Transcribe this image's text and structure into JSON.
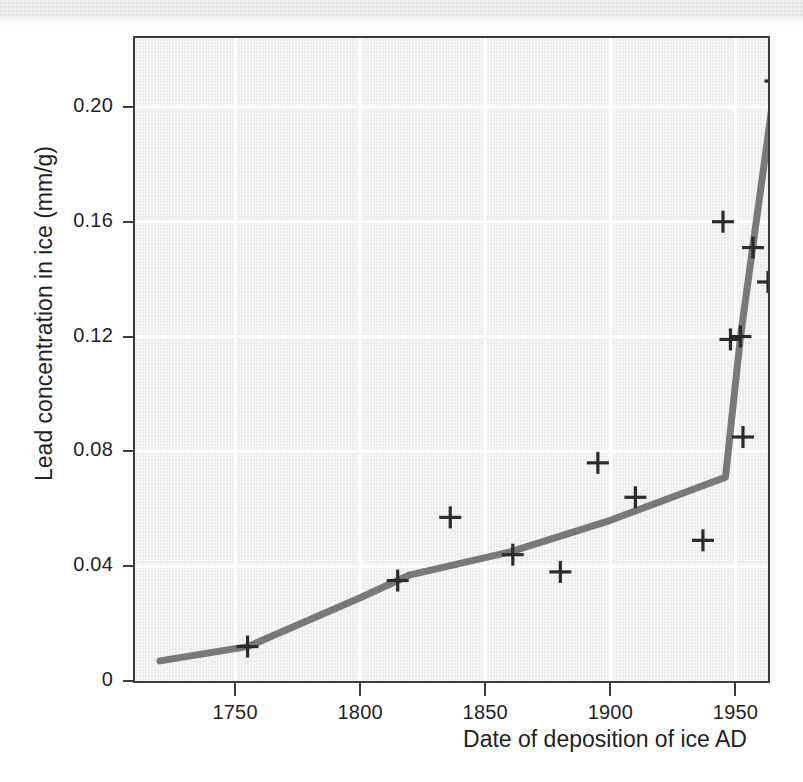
{
  "figure": {
    "background_color": "#ffffff",
    "plot_background_color": "#ebebeb",
    "frame_color": "#3b3b3b",
    "grid_color": "#ffffff",
    "line_color": "#6e6e6e",
    "marker_color": "#2b2b2b"
  },
  "chart_data": {
    "type": "scatter",
    "title": "",
    "subtitle": "",
    "xlabel": "Date of deposition of ice AD",
    "ylabel": "Lead concentration in ice (mm/g)",
    "xlim": [
      1710,
      1963
    ],
    "ylim": [
      0,
      0.224
    ],
    "xticks": [
      1750,
      1800,
      1850,
      1900,
      1950
    ],
    "xticklabels": [
      "1750",
      "1800",
      "1850",
      "1900",
      "1950"
    ],
    "yticks": [
      0,
      0.04,
      0.08,
      0.12,
      0.16,
      0.2
    ],
    "yticklabels": [
      "0",
      "0.04",
      "0.08",
      "0.12",
      "0.16",
      "0.20"
    ],
    "grid": true,
    "grid_axis": "both",
    "legend": false,
    "legend_position": "none",
    "marker_symbol": "plus",
    "series": [
      {
        "name": "Measured lead concentration",
        "type": "scatter",
        "marker": "+",
        "points": [
          {
            "x": 1755,
            "y": 0.012
          },
          {
            "x": 1815,
            "y": 0.035
          },
          {
            "x": 1836,
            "y": 0.057
          },
          {
            "x": 1861,
            "y": 0.044
          },
          {
            "x": 1880,
            "y": 0.038
          },
          {
            "x": 1895,
            "y": 0.076
          },
          {
            "x": 1910,
            "y": 0.064
          },
          {
            "x": 1937,
            "y": 0.049
          },
          {
            "x": 1948,
            "y": 0.119
          },
          {
            "x": 1952,
            "y": 0.12
          },
          {
            "x": 1953,
            "y": 0.085
          },
          {
            "x": 1945,
            "y": 0.16
          },
          {
            "x": 1957,
            "y": 0.151
          },
          {
            "x": 1963,
            "y": 0.139
          },
          {
            "x": 1966,
            "y": 0.209
          }
        ]
      },
      {
        "name": "Trend line",
        "type": "line",
        "points": [
          {
            "x": 1720,
            "y": 0.007
          },
          {
            "x": 1755,
            "y": 0.012
          },
          {
            "x": 1800,
            "y": 0.029
          },
          {
            "x": 1820,
            "y": 0.037
          },
          {
            "x": 1860,
            "y": 0.045
          },
          {
            "x": 1900,
            "y": 0.056
          },
          {
            "x": 1946,
            "y": 0.071
          },
          {
            "x": 1952,
            "y": 0.12
          },
          {
            "x": 1966,
            "y": 0.209
          }
        ]
      }
    ]
  }
}
